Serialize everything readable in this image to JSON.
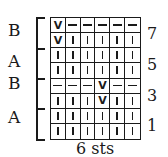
{
  "chart": {
    "columns": 6,
    "rows_top_to_bottom": [
      [
        "slip",
        "purl",
        "purl",
        "purl",
        "purl",
        "purl"
      ],
      [
        "slip",
        "knit",
        "knit",
        "knit",
        "knit",
        "knit"
      ],
      [
        "knit",
        "knit",
        "knit",
        "knit",
        "knit",
        "knit"
      ],
      [
        "knit",
        "knit",
        "knit",
        "knit",
        "knit",
        "knit"
      ],
      [
        "purl",
        "purl",
        "purl",
        "slip",
        "purl",
        "purl"
      ],
      [
        "knit",
        "knit",
        "knit",
        "slip",
        "knit",
        "knit"
      ],
      [
        "knit",
        "knit",
        "knit",
        "knit",
        "knit",
        "knit"
      ],
      [
        "knit",
        "knit",
        "knit",
        "knit",
        "knit",
        "knit"
      ]
    ],
    "symbols": {
      "knit": "|",
      "purl": "—",
      "slip": "V"
    }
  },
  "sections": [
    {
      "label": "B",
      "top": 22
    },
    {
      "label": "A",
      "top": 53
    },
    {
      "label": "B",
      "top": 75
    },
    {
      "label": "A",
      "top": 109
    }
  ],
  "section_ticks": [
    48,
    78,
    108
  ],
  "row_numbers": [
    {
      "label": "7",
      "top": 26
    },
    {
      "label": "5",
      "top": 57
    },
    {
      "label": "3",
      "top": 88
    },
    {
      "label": "1",
      "top": 118
    }
  ],
  "stitch_count": "6 sts"
}
